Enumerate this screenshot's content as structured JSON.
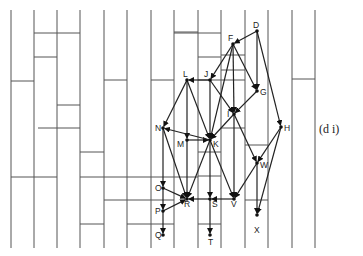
{
  "figure": {
    "caption": "(d i)",
    "colors": {
      "line": "#555555",
      "edge": "#222222",
      "background": "#ffffff"
    }
  },
  "grid": {
    "verticals": [
      11,
      34,
      57,
      80,
      104,
      127,
      151,
      174,
      198,
      221,
      245,
      268,
      292,
      315
    ],
    "top": 10,
    "bottom": 248,
    "horizontals": [
      {
        "x1": 34,
        "x2": 80,
        "y": 33
      },
      {
        "x1": 34,
        "x2": 57,
        "y": 57
      },
      {
        "x1": 11,
        "x2": 34,
        "y": 81
      },
      {
        "x1": 57,
        "x2": 80,
        "y": 105
      },
      {
        "x1": 104,
        "x2": 127,
        "y": 80
      },
      {
        "x1": 151,
        "x2": 174,
        "y": 80
      },
      {
        "x1": 174,
        "x2": 198,
        "y": 32
      },
      {
        "x1": 174,
        "x2": 221,
        "y": 33
      },
      {
        "x1": 198,
        "x2": 221,
        "y": 57
      },
      {
        "x1": 221,
        "x2": 245,
        "y": 55
      },
      {
        "x1": 198,
        "x2": 245,
        "y": 80
      },
      {
        "x1": 221,
        "x2": 245,
        "y": 70
      },
      {
        "x1": 292,
        "x2": 315,
        "y": 79
      },
      {
        "x1": 38,
        "x2": 80,
        "y": 128
      },
      {
        "x1": 80,
        "x2": 104,
        "y": 152
      },
      {
        "x1": 11,
        "x2": 57,
        "y": 177
      },
      {
        "x1": 80,
        "x2": 198,
        "y": 177
      },
      {
        "x1": 104,
        "x2": 174,
        "y": 200
      },
      {
        "x1": 80,
        "x2": 104,
        "y": 224
      },
      {
        "x1": 127,
        "x2": 174,
        "y": 224
      },
      {
        "x1": 198,
        "x2": 221,
        "y": 152
      },
      {
        "x1": 198,
        "x2": 221,
        "y": 176
      },
      {
        "x1": 221,
        "x2": 245,
        "y": 128
      },
      {
        "x1": 198,
        "x2": 221,
        "y": 224
      },
      {
        "x1": 245,
        "x2": 268,
        "y": 200
      },
      {
        "x1": 245,
        "x2": 268,
        "y": 145
      }
    ]
  },
  "nodes": [
    {
      "id": "D",
      "x": 257,
      "y": 31,
      "lx": 253,
      "ly": 28
    },
    {
      "id": "F",
      "x": 233,
      "y": 44,
      "lx": 228,
      "ly": 41
    },
    {
      "id": "L",
      "x": 187,
      "y": 80,
      "lx": 183,
      "ly": 77
    },
    {
      "id": "J",
      "x": 210,
      "y": 80,
      "lx": 204,
      "ly": 77
    },
    {
      "id": "G",
      "x": 257,
      "y": 91,
      "lx": 260,
      "ly": 95
    },
    {
      "id": "I",
      "x": 234,
      "y": 114,
      "lx": 227,
      "ly": 117
    },
    {
      "id": "N",
      "x": 163,
      "y": 128,
      "lx": 155,
      "ly": 131
    },
    {
      "id": "H",
      "x": 281,
      "y": 127,
      "lx": 284,
      "ly": 131
    },
    {
      "id": "M",
      "x": 187,
      "y": 140,
      "lx": 177,
      "ly": 147
    },
    {
      "id": "K",
      "x": 210,
      "y": 140,
      "lx": 213,
      "ly": 147
    },
    {
      "id": "W",
      "x": 257,
      "y": 163,
      "lx": 260,
      "ly": 168
    },
    {
      "id": "O",
      "x": 163,
      "y": 188,
      "lx": 155,
      "ly": 191
    },
    {
      "id": "R",
      "x": 187,
      "y": 199,
      "lx": 184,
      "ly": 207
    },
    {
      "id": "S",
      "x": 210,
      "y": 199,
      "lx": 212,
      "ly": 207
    },
    {
      "id": "V",
      "x": 234,
      "y": 199,
      "lx": 231,
      "ly": 207
    },
    {
      "id": "P",
      "x": 163,
      "y": 211,
      "lx": 155,
      "ly": 214
    },
    {
      "id": "X",
      "x": 257,
      "y": 215,
      "lx": 254,
      "ly": 233
    },
    {
      "id": "Q",
      "x": 163,
      "y": 235,
      "lx": 155,
      "ly": 238
    },
    {
      "id": "T",
      "x": 210,
      "y": 235,
      "lx": 208,
      "ly": 245
    }
  ],
  "edges": [
    [
      "D",
      "F"
    ],
    [
      "D",
      "G"
    ],
    [
      "D",
      "H"
    ],
    [
      "F",
      "J"
    ],
    [
      "F",
      "G"
    ],
    [
      "F",
      "I"
    ],
    [
      "J",
      "L"
    ],
    [
      "J",
      "I"
    ],
    [
      "J",
      "K"
    ],
    [
      "G",
      "I"
    ],
    [
      "L",
      "N"
    ],
    [
      "L",
      "M"
    ],
    [
      "L",
      "K"
    ],
    [
      "I",
      "K"
    ],
    [
      "I",
      "V"
    ],
    [
      "I",
      "W"
    ],
    [
      "N",
      "O"
    ],
    [
      "N",
      "R"
    ],
    [
      "M",
      "K"
    ],
    [
      "M",
      "R"
    ],
    [
      "K",
      "N"
    ],
    [
      "K",
      "R"
    ],
    [
      "K",
      "S"
    ],
    [
      "K",
      "V"
    ],
    [
      "H",
      "W"
    ],
    [
      "H",
      "X"
    ],
    [
      "W",
      "V"
    ],
    [
      "W",
      "X"
    ],
    [
      "O",
      "R"
    ],
    [
      "O",
      "P"
    ],
    [
      "P",
      "R"
    ],
    [
      "P",
      "Q"
    ],
    [
      "S",
      "R"
    ],
    [
      "S",
      "T"
    ],
    [
      "V",
      "S"
    ],
    [
      "F",
      "K"
    ]
  ]
}
